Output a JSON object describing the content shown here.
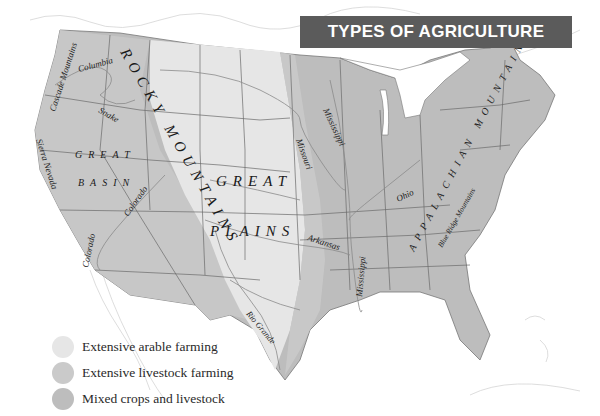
{
  "title": "TYPES OF AGRICULTURE",
  "colors": {
    "extensive_arable": "#e6e6e6",
    "extensive_livestock": "#cacaca",
    "mixed": "#bdbdbd",
    "banner": "#5b5b5b",
    "land_outside": "#ffffff",
    "border": "#555555",
    "river": "#8a8a8a"
  },
  "legend": [
    {
      "label": "Extensive arable farming",
      "color_key": "extensive_arable"
    },
    {
      "label": "Extensive livestock farming",
      "color_key": "extensive_livestock"
    },
    {
      "label": "Mixed crops and livestock",
      "color_key": "mixed"
    }
  ],
  "regions": {
    "rocky_mountains": "ROCKY MOUNTAINS",
    "great_basin_1": "GREAT",
    "great_basin_2": "BASIN",
    "great_plains_1": "GREAT",
    "great_plains_2": "PLAINS",
    "appalachian": "APPALACHIAN MOUNTAINS"
  },
  "features": {
    "cascade": "Cascade Mountains",
    "columbia": "Columbia",
    "snake": "Snake",
    "sierra": "Sierra Nevada",
    "colorado_1": "Colorado",
    "colorado_2": "Colorado",
    "missouri": "Missouri",
    "mississippi_1": "Mississippi",
    "mississippi_2": "Mississippi",
    "arkansas": "Arkansas",
    "ohio": "Ohio",
    "rio_grande": "Rio Grande",
    "blue_ridge": "Blue Ridge Mountains"
  }
}
